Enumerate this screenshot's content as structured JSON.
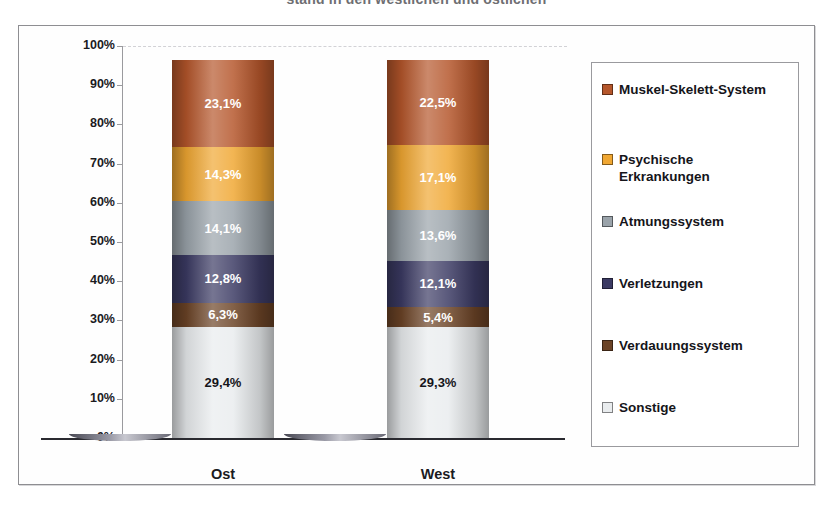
{
  "title": {
    "text": "stand in den westlichen und östlichen",
    "note": "cropped at top edge of screenshot"
  },
  "colors": {
    "muskel_skelett": "#b5562b",
    "psychische": "#f0a732",
    "atmungssystem": "#9aa3aa",
    "verletzungen": "#3b3a63",
    "verdauungssystem": "#6b4326",
    "sonstige": "#e9ecee",
    "axis": "#9a9a9e",
    "frame": "#8e8e92",
    "text": "#15151a",
    "baseline": "#2a2a30"
  },
  "chart_data": {
    "type": "bar",
    "stacked": true,
    "stack_mode": "percent",
    "title": "stand in den westlichen und östlichen",
    "xlabel": "",
    "ylabel": "",
    "ylim": [
      0,
      100
    ],
    "grid": true,
    "legend_position": "right",
    "categories": [
      "Ost",
      "West"
    ],
    "ytick_labels": [
      "100%",
      "90%",
      "80%",
      "70%",
      "60%",
      "50%",
      "40%",
      "30%",
      "20%",
      "10%",
      "0%"
    ],
    "ytick_values": [
      100,
      90,
      80,
      70,
      60,
      50,
      40,
      30,
      20,
      10,
      0
    ],
    "series": [
      {
        "name": "Muskel-Skelett-System",
        "color": "#b5562b",
        "values": [
          23.1,
          22.5
        ],
        "labels": [
          "23,1%",
          "22,5%"
        ],
        "label_color": "#ffffff"
      },
      {
        "name": "Psychische Erkrankungen",
        "color": "#f0a732",
        "values": [
          14.3,
          17.1
        ],
        "labels": [
          "14,3%",
          "17,1%"
        ],
        "label_color": "#ffffff"
      },
      {
        "name": "Atmungssystem",
        "color": "#9aa3aa",
        "values": [
          14.1,
          13.6
        ],
        "labels": [
          "14,1%",
          "13,6%"
        ],
        "label_color": "#ffffff"
      },
      {
        "name": "Verletzungen",
        "color": "#3b3a63",
        "values": [
          12.8,
          12.1
        ],
        "labels": [
          "12,8%",
          "12,1%"
        ],
        "label_color": "#ffffff"
      },
      {
        "name": "Verdauungssystem",
        "color": "#6b4326",
        "values": [
          6.3,
          5.4
        ],
        "labels": [
          "6,3%",
          "5,4%"
        ],
        "label_color": "#ffffff"
      },
      {
        "name": "Sonstige",
        "color": "#e9ecee",
        "values": [
          29.4,
          29.3
        ],
        "labels": [
          "29,4%",
          "29,3%"
        ],
        "label_color": "#15151a"
      }
    ]
  },
  "legend": {
    "items": [
      {
        "label": "Muskel-Skelett-System",
        "color": "#b5562b"
      },
      {
        "label": "Psychische\nErkrankungen",
        "color": "#f0a732"
      },
      {
        "label": "Atmungssystem",
        "color": "#9aa3aa"
      },
      {
        "label": "Verletzungen",
        "color": "#3b3a63"
      },
      {
        "label": "Verdauungssystem",
        "color": "#6b4326"
      },
      {
        "label": "Sonstige",
        "color": "#e9ecee"
      }
    ]
  },
  "axis": {
    "x_categories": [
      "Ost",
      "West"
    ]
  }
}
